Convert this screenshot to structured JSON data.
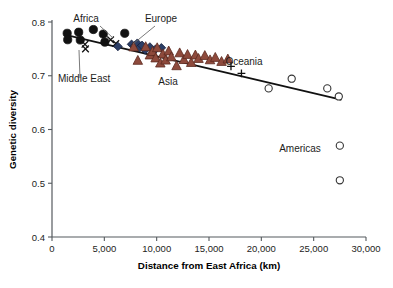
{
  "figure": {
    "background": "#ffffff",
    "plot_area": {
      "x0": 52,
      "y0": 22,
      "x1": 366,
      "y1": 237
    }
  },
  "chart_data": {
    "type": "scatter",
    "title": "",
    "xlabel": "Distance from East Africa (km)",
    "ylabel": "Genetic diversity",
    "xlim": [
      0,
      30000
    ],
    "ylim": [
      0.4,
      0.8
    ],
    "xticks": [
      0,
      5000,
      10000,
      15000,
      20000,
      25000,
      30000
    ],
    "xticklabels": [
      "0",
      "5,000",
      "10,000",
      "15,000",
      "20,000",
      "25,000",
      "30,000"
    ],
    "yticks": [
      0.4,
      0.5,
      0.6,
      0.7,
      0.8
    ],
    "yticklabels": [
      "0.4",
      "0.5",
      "0.6",
      "0.7",
      "0.8"
    ],
    "grid": false,
    "legend_position": "none",
    "trendline": {
      "x": [
        1400,
        27600
      ],
      "y": [
        0.7755,
        0.6555
      ],
      "color": "#111111"
    },
    "series": [
      {
        "name": "Africa",
        "marker": "circle",
        "color": "#111111",
        "edge": "#111111",
        "points": [
          [
            1450,
            0.779
          ],
          [
            1500,
            0.767
          ],
          [
            2550,
            0.781
          ],
          [
            2700,
            0.7665
          ],
          [
            3950,
            0.786
          ],
          [
            4900,
            0.7775
          ],
          [
            5050,
            0.7625
          ],
          [
            6950,
            0.779
          ]
        ]
      },
      {
        "name": "Middle East",
        "marker": "x",
        "color": "#111111",
        "edge": "#111111",
        "points": [
          [
            3150,
            0.7585
          ],
          [
            3200,
            0.75
          ],
          [
            5600,
            0.767
          ],
          [
            6100,
            0.76
          ]
        ]
      },
      {
        "name": "Europe",
        "marker": "diamond",
        "color": "#2c3e66",
        "edge": "#14203d",
        "points": [
          [
            6300,
            0.7545
          ],
          [
            7600,
            0.7585
          ],
          [
            7900,
            0.7555
          ],
          [
            8150,
            0.7605
          ],
          [
            8350,
            0.752
          ],
          [
            8600,
            0.7565
          ],
          [
            8900,
            0.748
          ],
          [
            9350,
            0.7535
          ],
          [
            9900,
            0.7495
          ],
          [
            10450,
            0.752
          ]
        ]
      },
      {
        "name": "Asia",
        "marker": "triangle",
        "color": "#8e4a3c",
        "edge": "#5d2b21",
        "points": [
          [
            7800,
            0.7535
          ],
          [
            8200,
            0.7285
          ],
          [
            8950,
            0.754
          ],
          [
            9350,
            0.7385
          ],
          [
            9600,
            0.745
          ],
          [
            9900,
            0.733
          ],
          [
            10050,
            0.752
          ],
          [
            10350,
            0.7235
          ],
          [
            10600,
            0.7405
          ],
          [
            10850,
            0.729
          ],
          [
            11150,
            0.746
          ],
          [
            11400,
            0.735
          ],
          [
            11900,
            0.7185
          ],
          [
            12200,
            0.7425
          ],
          [
            12600,
            0.73
          ],
          [
            12950,
            0.7395
          ],
          [
            13300,
            0.7245
          ],
          [
            13700,
            0.7385
          ],
          [
            14000,
            0.732
          ],
          [
            14600,
            0.7375
          ],
          [
            15100,
            0.7295
          ],
          [
            15600,
            0.734
          ],
          [
            16200,
            0.7265
          ],
          [
            16800,
            0.731
          ]
        ]
      },
      {
        "name": "Oceania",
        "marker": "plus",
        "color": "#111111",
        "edge": "#111111",
        "points": [
          [
            17100,
            0.7175
          ],
          [
            18100,
            0.7045
          ]
        ]
      },
      {
        "name": "Americas",
        "marker": "open-circle",
        "color": "#ffffff",
        "edge": "#333333",
        "points": [
          [
            20700,
            0.6765
          ],
          [
            22900,
            0.6945
          ],
          [
            26300,
            0.6765
          ],
          [
            27400,
            0.6615
          ],
          [
            27500,
            0.57
          ],
          [
            27500,
            0.5055
          ]
        ]
      }
    ],
    "annotations": [
      {
        "label": "Africa",
        "x": 86,
        "y": 22,
        "anchor": "middle"
      },
      {
        "label": "Europe",
        "x": 161,
        "y": 22,
        "anchor": "middle"
      },
      {
        "label": "Middle East",
        "x": 58,
        "y": 82,
        "anchor": "start"
      },
      {
        "label": "Asia",
        "x": 168,
        "y": 85,
        "anchor": "middle"
      },
      {
        "label": "Oceania",
        "x": 244,
        "y": 65,
        "anchor": "middle"
      },
      {
        "label": "Americas",
        "x": 300,
        "y": 152,
        "anchor": "middle"
      }
    ]
  }
}
